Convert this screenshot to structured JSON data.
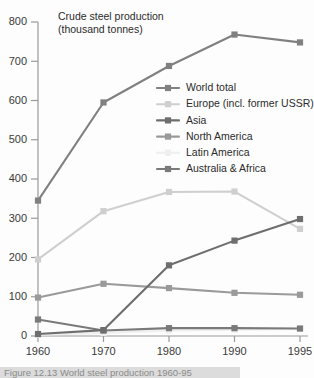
{
  "chart_data": {
    "type": "line",
    "title": "Crude steel production",
    "subtitle": "(thousand tonnes)",
    "xlabel": "",
    "ylabel": "",
    "x": [
      1960,
      1970,
      1980,
      1990,
      1995
    ],
    "categories": [
      "1960",
      "1970",
      "1980",
      "1990",
      "1995"
    ],
    "ylim": [
      0,
      800
    ],
    "yticks": [
      0,
      100,
      200,
      300,
      400,
      500,
      600,
      700,
      800
    ],
    "ytick_labels": [
      "0",
      "100",
      "200",
      "300",
      "400",
      "500",
      "600",
      "700",
      "800"
    ],
    "grid": false,
    "legend_position": "inside-upper-right",
    "marker": "square",
    "series": [
      {
        "name": "World total",
        "color": "#808080",
        "values": [
          345,
          595,
          688,
          768,
          748
        ]
      },
      {
        "name": "Europe (incl. former USSR)",
        "color": "#cfcfcf",
        "values": [
          195,
          318,
          367,
          368,
          273
        ]
      },
      {
        "name": "Asia",
        "color": "#6e6e6e",
        "values": [
          5,
          15,
          180,
          243,
          298
        ]
      },
      {
        "name": "North America",
        "color": "#9a9a9a",
        "values": [
          98,
          133,
          122,
          110,
          105
        ]
      },
      {
        "name": "Latin America",
        "color": "#efefef",
        "values": [
          3,
          8,
          14,
          16,
          18
        ]
      },
      {
        "name": "Australia & Africa",
        "color": "#7a7a7a",
        "values": [
          42,
          14,
          20,
          20,
          19
        ]
      }
    ]
  },
  "caption": {
    "text": "Figure 12.13  World steel production 1960-95"
  }
}
